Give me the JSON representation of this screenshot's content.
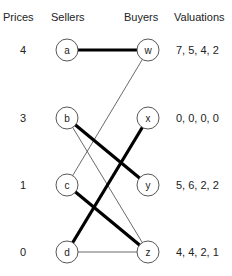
{
  "headers": {
    "prices": "Prices",
    "sellers": "Sellers",
    "buyers": "Buyers",
    "valuations": "Valuations"
  },
  "rows": [
    {
      "price": "4",
      "seller": "a",
      "buyer": "w",
      "valuations": "7, 5, 4, 2"
    },
    {
      "price": "3",
      "seller": "b",
      "buyer": "x",
      "valuations": "0, 0, 0, 0"
    },
    {
      "price": "1",
      "seller": "c",
      "buyer": "y",
      "valuations": "5, 6, 2, 2"
    },
    {
      "price": "0",
      "seller": "d",
      "buyer": "z",
      "valuations": "4, 4, 2, 1"
    }
  ],
  "edges": [
    {
      "from": "a",
      "to": "w",
      "style": "thick"
    },
    {
      "from": "c",
      "to": "w",
      "style": "thin"
    },
    {
      "from": "b",
      "to": "y",
      "style": "thick"
    },
    {
      "from": "b",
      "to": "z",
      "style": "thin"
    },
    {
      "from": "d",
      "to": "x",
      "style": "thick"
    },
    {
      "from": "c",
      "to": "z",
      "style": "thick"
    },
    {
      "from": "d",
      "to": "z",
      "style": "thin"
    }
  ]
}
